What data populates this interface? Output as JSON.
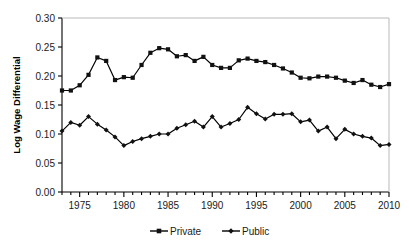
{
  "chart_data": {
    "type": "line",
    "title": "",
    "xlabel": "",
    "ylabel": "Log Wage Differential",
    "xlim": [
      1973,
      2010
    ],
    "ylim": [
      0.0,
      0.3
    ],
    "ytick_step": 0.05,
    "xtick_step": 5,
    "xtick_minor_step": 1,
    "grid": false,
    "legend_position": "bottom-center",
    "ytick_labels": [
      "0.00",
      "0.05",
      "0.10",
      "0.15",
      "0.20",
      "0.25",
      "0.30"
    ],
    "ytick_values": [
      0.0,
      0.05,
      0.1,
      0.15,
      0.2,
      0.25,
      0.3
    ],
    "xtick_labels": [
      "1975",
      "1980",
      "1985",
      "1990",
      "1995",
      "2000",
      "2005",
      "2010"
    ],
    "xtick_values": [
      1975,
      1980,
      1985,
      1990,
      1995,
      2000,
      2005,
      2010
    ],
    "x": [
      1973,
      1974,
      1975,
      1976,
      1977,
      1978,
      1979,
      1980,
      1981,
      1982,
      1983,
      1984,
      1985,
      1986,
      1987,
      1988,
      1989,
      1990,
      1991,
      1992,
      1993,
      1994,
      1995,
      1996,
      1997,
      1998,
      1999,
      2000,
      2001,
      2002,
      2003,
      2004,
      2005,
      2006,
      2007,
      2008,
      2009,
      2010
    ],
    "series": [
      {
        "name": "Private",
        "marker": "square",
        "color": "#000000",
        "values": [
          0.175,
          0.175,
          0.184,
          0.202,
          0.232,
          0.226,
          0.193,
          0.198,
          0.197,
          0.219,
          0.24,
          0.248,
          0.246,
          0.234,
          0.236,
          0.226,
          0.233,
          0.219,
          0.214,
          0.214,
          0.227,
          0.23,
          0.226,
          0.224,
          0.219,
          0.213,
          0.206,
          0.197,
          0.196,
          0.199,
          0.199,
          0.197,
          0.192,
          0.188,
          0.193,
          0.185,
          0.181,
          0.186
        ]
      },
      {
        "name": "Public",
        "marker": "diamond",
        "color": "#000000",
        "values": [
          0.105,
          0.12,
          0.115,
          0.13,
          0.117,
          0.107,
          0.095,
          0.08,
          0.087,
          0.092,
          0.096,
          0.1,
          0.1,
          0.11,
          0.116,
          0.122,
          0.112,
          0.13,
          0.112,
          0.118,
          0.125,
          0.146,
          0.135,
          0.126,
          0.134,
          0.134,
          0.135,
          0.121,
          0.124,
          0.105,
          0.112,
          0.092,
          0.108,
          0.1,
          0.096,
          0.093,
          0.08,
          0.082
        ]
      }
    ]
  },
  "legend": {
    "items": [
      {
        "label": "Private"
      },
      {
        "label": "Public"
      }
    ]
  }
}
